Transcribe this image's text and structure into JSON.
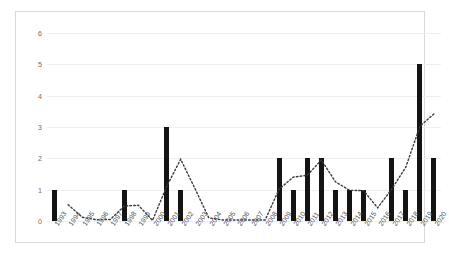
{
  "chart_data": {
    "type": "bar",
    "title": "",
    "subtitle": "",
    "xlabel": "",
    "ylabel": "",
    "ylim": [
      0,
      6
    ],
    "yticks": [
      0,
      1,
      2,
      3,
      4,
      5,
      6
    ],
    "grid": true,
    "legend": null,
    "legend_position": "none",
    "categories": [
      "1993",
      "1994",
      "1995",
      "1996",
      "1997",
      "1998",
      "1999",
      "2000",
      "2001",
      "2002",
      "2003",
      "2004",
      "2005",
      "2006",
      "2007",
      "2008",
      "2009",
      "2010",
      "2011",
      "2012",
      "2013",
      "2014",
      "2015",
      "2016",
      "2017",
      "2018",
      "2019",
      "2020"
    ],
    "values": [
      1,
      0,
      0,
      0,
      0,
      1,
      0,
      0,
      3,
      1,
      0,
      0,
      0,
      0,
      0,
      0,
      2,
      1,
      2,
      2,
      1,
      1,
      1,
      0,
      2,
      1,
      5,
      2
    ],
    "series": [
      {
        "name": "Count",
        "type": "bar",
        "color": "#141414",
        "values": [
          1,
          0,
          0,
          0,
          0,
          1,
          0,
          0,
          3,
          1,
          0,
          0,
          0,
          0,
          0,
          0,
          2,
          1,
          2,
          2,
          1,
          1,
          1,
          0,
          2,
          1,
          5,
          2
        ]
      },
      {
        "name": "Trend",
        "type": "line",
        "style": "dotted",
        "color": "#3a3a3a",
        "values": [
          null,
          0.52,
          0.12,
          0.04,
          0.05,
          0.48,
          0.5,
          0.02,
          1.1,
          1.97,
          1.05,
          0.1,
          0.03,
          0.03,
          0.03,
          0.03,
          1.02,
          1.4,
          1.46,
          1.95,
          1.25,
          0.98,
          0.97,
          0.42,
          1.02,
          1.72,
          3.02,
          3.42
        ]
      }
    ]
  },
  "axes": {
    "y_tick_labels": [
      "6",
      "5",
      "4",
      "3",
      "2",
      "1",
      "0"
    ],
    "x_tick_labels": [
      "1993",
      "1994",
      "1995",
      "1996",
      "1997",
      "1998",
      "1999",
      "2000",
      "2001",
      "2002",
      "2003",
      "2004",
      "2005",
      "2006",
      "2007",
      "2008",
      "2009",
      "2010",
      "2011",
      "2012",
      "2013",
      "2014",
      "2015",
      "2016",
      "2017",
      "2018",
      "2019",
      "2020"
    ]
  },
  "style": {
    "bar_color": "#141414",
    "trend_color": "#3a3a3a",
    "gridline_color": "#efefef",
    "frame_color": "#d9d9d9",
    "background": "#ffffff",
    "tick_text_color": "#555555"
  }
}
